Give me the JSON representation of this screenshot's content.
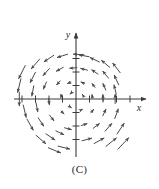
{
  "figure": {
    "caption": "(C)",
    "background_color": "#ffffff",
    "stroke_color": "#4a4a4a",
    "axis_color": "#3a3a3a"
  },
  "axes": {
    "x_label": "x",
    "y_label": "y",
    "x_range": [
      -4.6,
      4.6
    ],
    "y_range": [
      -4.2,
      4.2
    ],
    "x_ticks": [
      -4,
      -3,
      -2,
      -1,
      1,
      2,
      3,
      4
    ],
    "y_ticks": [
      -3,
      -2,
      -1,
      1,
      2,
      3
    ],
    "origin_px": [
      76,
      99
    ],
    "unit_px": 13.5,
    "grid": false
  },
  "chart_data": {
    "type": "scatter",
    "title": "",
    "subtitle": "",
    "xlabel": "x",
    "ylabel": "y",
    "xlim": [
      -4.6,
      4.6
    ],
    "ylim": [
      -4.2,
      4.2
    ],
    "grid": false,
    "legend": "none",
    "field_rule": "F(x,y) = (-y, x)",
    "rotation": "counterclockwise",
    "vectors": [
      {
        "x": -4.0,
        "y": 2.0,
        "u": -2.0,
        "v": -4.0
      },
      {
        "x": -3.0,
        "y": 2.6,
        "u": -2.6,
        "v": -3.0
      },
      {
        "x": -2.0,
        "y": 3.0,
        "u": -3.0,
        "v": -2.0
      },
      {
        "x": -1.0,
        "y": 3.2,
        "u": -3.2,
        "v": -1.0
      },
      {
        "x": 0.2,
        "y": 3.3,
        "u": -3.3,
        "v": 0.2
      },
      {
        "x": -4.2,
        "y": 1.0,
        "u": -1.0,
        "v": -4.2
      },
      {
        "x": -3.2,
        "y": 1.6,
        "u": -1.6,
        "v": -3.2
      },
      {
        "x": -2.2,
        "y": 2.0,
        "u": -2.0,
        "v": -2.2
      },
      {
        "x": -1.2,
        "y": 2.2,
        "u": -2.2,
        "v": -1.2
      },
      {
        "x": -0.2,
        "y": 2.3,
        "u": -2.3,
        "v": -0.2
      },
      {
        "x": -4.2,
        "y": 0.0,
        "u": 0.0,
        "v": -4.2
      },
      {
        "x": -3.2,
        "y": 0.6,
        "u": -0.6,
        "v": -3.2
      },
      {
        "x": -2.3,
        "y": 1.0,
        "u": -1.0,
        "v": -2.3
      },
      {
        "x": -1.3,
        "y": 1.2,
        "u": -1.2,
        "v": -1.3
      },
      {
        "x": -0.5,
        "y": 1.2,
        "u": -1.2,
        "v": -0.5
      },
      {
        "x": -3.8,
        "y": -0.9,
        "u": 0.9,
        "v": -3.8
      },
      {
        "x": -2.9,
        "y": -0.6,
        "u": 0.6,
        "v": -2.9
      },
      {
        "x": -2.0,
        "y": -0.2,
        "u": 0.2,
        "v": -2.0
      },
      {
        "x": -1.1,
        "y": 0.2,
        "u": -0.2,
        "v": -1.1
      },
      {
        "x": -0.4,
        "y": 0.4,
        "u": -0.4,
        "v": -0.4
      },
      {
        "x": -3.4,
        "y": -1.9,
        "u": 1.9,
        "v": -3.4
      },
      {
        "x": -2.6,
        "y": -1.7,
        "u": 1.7,
        "v": -2.6
      },
      {
        "x": -1.8,
        "y": -1.4,
        "u": 1.4,
        "v": -1.8
      },
      {
        "x": -1.0,
        "y": -1.0,
        "u": 1.0,
        "v": -1.0
      },
      {
        "x": -0.4,
        "y": -0.6,
        "u": 0.6,
        "v": -0.4
      },
      {
        "x": -2.6,
        "y": -3.0,
        "u": 3.0,
        "v": -2.6
      },
      {
        "x": -1.9,
        "y": -2.8,
        "u": 2.8,
        "v": -1.9
      },
      {
        "x": -1.2,
        "y": -2.5,
        "u": 2.5,
        "v": -1.2
      },
      {
        "x": -0.6,
        "y": -2.2,
        "u": 2.2,
        "v": -0.6
      },
      {
        "x": -1.6,
        "y": -3.8,
        "u": 3.8,
        "v": -1.6
      },
      {
        "x": -0.9,
        "y": -3.6,
        "u": 3.6,
        "v": -0.9
      },
      {
        "x": 0.6,
        "y": 3.2,
        "u": -3.2,
        "v": 0.6
      },
      {
        "x": 1.4,
        "y": 2.9,
        "u": -2.9,
        "v": 1.4
      },
      {
        "x": 2.2,
        "y": 2.6,
        "u": -2.6,
        "v": 2.2
      },
      {
        "x": 3.0,
        "y": 2.3,
        "u": -2.3,
        "v": 3.0
      },
      {
        "x": 0.6,
        "y": 2.2,
        "u": -2.2,
        "v": 0.6
      },
      {
        "x": 1.4,
        "y": 2.0,
        "u": -2.0,
        "v": 1.4
      },
      {
        "x": 2.2,
        "y": 1.8,
        "u": -1.8,
        "v": 2.2
      },
      {
        "x": 3.0,
        "y": 1.4,
        "u": -1.4,
        "v": 3.0
      },
      {
        "x": 0.5,
        "y": 1.2,
        "u": -1.2,
        "v": 0.5
      },
      {
        "x": 1.3,
        "y": 1.0,
        "u": -1.0,
        "v": 1.3
      },
      {
        "x": 2.1,
        "y": 0.9,
        "u": -0.9,
        "v": 2.1
      },
      {
        "x": 2.9,
        "y": 0.7,
        "u": -0.7,
        "v": 2.9
      },
      {
        "x": 0.5,
        "y": 0.3,
        "u": -0.3,
        "v": 0.5
      },
      {
        "x": 1.2,
        "y": 0.2,
        "u": -0.2,
        "v": 1.2
      },
      {
        "x": 2.0,
        "y": 0.1,
        "u": -0.1,
        "v": 2.0
      },
      {
        "x": 2.9,
        "y": 0.0,
        "u": 0.0,
        "v": 2.9
      },
      {
        "x": 0.4,
        "y": -0.8,
        "u": 0.8,
        "v": 0.4
      },
      {
        "x": 1.2,
        "y": -0.9,
        "u": 0.9,
        "v": 1.2
      },
      {
        "x": 2.1,
        "y": -1.0,
        "u": 1.0,
        "v": 2.1
      },
      {
        "x": 3.0,
        "y": -1.1,
        "u": 1.1,
        "v": 3.0
      },
      {
        "x": 0.6,
        "y": -1.9,
        "u": 1.9,
        "v": 0.6
      },
      {
        "x": 1.5,
        "y": -2.0,
        "u": 2.0,
        "v": 1.5
      },
      {
        "x": 2.4,
        "y": -2.1,
        "u": 2.1,
        "v": 2.4
      },
      {
        "x": 3.3,
        "y": -2.2,
        "u": 2.2,
        "v": 3.3
      },
      {
        "x": 0.8,
        "y": -3.0,
        "u": 3.0,
        "v": 0.8
      },
      {
        "x": 1.7,
        "y": -3.1,
        "u": 3.1,
        "v": 1.7
      },
      {
        "x": 2.6,
        "y": -3.2,
        "u": 3.2,
        "v": 2.6
      },
      {
        "x": 3.5,
        "y": -3.3,
        "u": 3.3,
        "v": 3.5
      }
    ]
  }
}
